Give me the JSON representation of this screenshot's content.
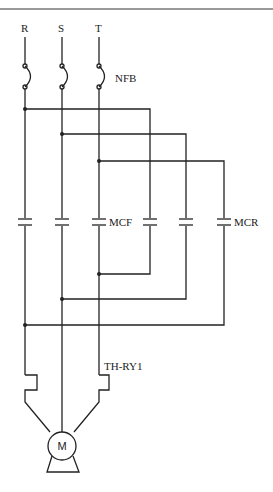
{
  "diagram": {
    "type": "three-phase forward/reverse motor control circuit",
    "phases": [
      "R",
      "S",
      "T"
    ],
    "labels": {
      "breaker": "NFB",
      "forward_contactor": "MCF",
      "reverse_contactor": "MCR",
      "thermal_relay": "TH-RY1",
      "motor": "M"
    },
    "colors": {
      "line": "#222222",
      "header_rule": "#9a9a9a",
      "background": "#ffffff"
    }
  }
}
